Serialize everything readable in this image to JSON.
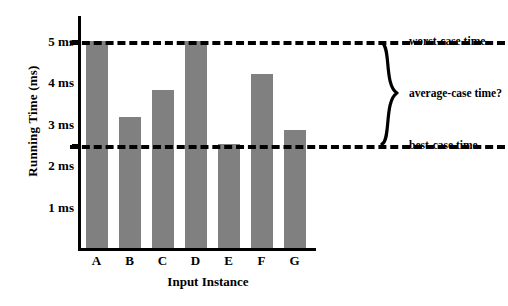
{
  "chart_data": {
    "type": "bar",
    "title": "",
    "xlabel": "Input Instance",
    "ylabel": "Running Time (ms)",
    "categories": [
      "A",
      "B",
      "C",
      "D",
      "E",
      "F",
      "G"
    ],
    "values": [
      5.0,
      3.15,
      3.8,
      5.0,
      2.5,
      4.2,
      2.85
    ],
    "bar_color": "#808080",
    "ylim": [
      0,
      5.6
    ],
    "yticks": [
      5,
      4,
      3,
      2,
      1
    ],
    "ytick_labels": [
      "5 ms",
      "4 ms",
      "3 ms",
      "2 ms",
      "1 ms"
    ],
    "grid": false,
    "legend": "none",
    "reference_lines": [
      {
        "label": "worst-case time",
        "value": 5.0,
        "style": "dashed",
        "color": "#000000"
      },
      {
        "label": "best-case time",
        "value": 2.5,
        "style": "dashed",
        "color": "#000000"
      }
    ],
    "annotations": [
      {
        "label": "average-case time?",
        "span": [
          2.5,
          5.0
        ],
        "marker": "curly-brace"
      }
    ]
  },
  "axes": {
    "ylabel": "Running Time (ms)",
    "xlabel": "Input Instance",
    "ytick_labels": [
      "5 ms",
      "4 ms",
      "3 ms",
      "2 ms",
      "1 ms"
    ],
    "xtick_labels": [
      "A",
      "B",
      "C",
      "D",
      "E",
      "F",
      "G"
    ]
  },
  "annotations": {
    "worst": "worst-case time",
    "average": "average-case time?",
    "best": "best-case time"
  }
}
